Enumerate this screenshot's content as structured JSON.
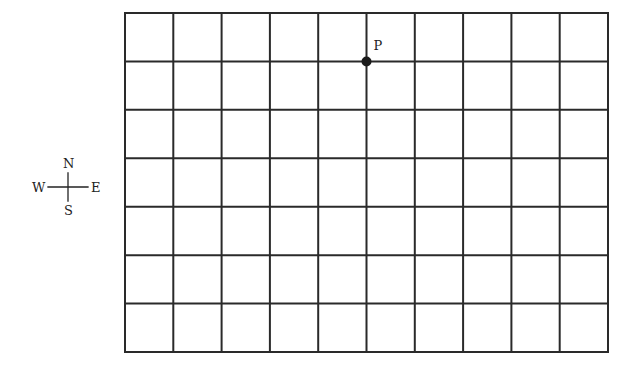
{
  "diagram": {
    "type": "grid-map",
    "grid": {
      "columns": 10,
      "rows": 7,
      "left": 125,
      "top": 13,
      "right": 608,
      "bottom": 352,
      "line_color": "#2a2a2a",
      "line_width": 2
    },
    "point": {
      "label": "P",
      "grid_col": 5,
      "grid_row": 1,
      "color": "#1a1a1a"
    },
    "compass": {
      "north": "N",
      "south": "S",
      "east": "E",
      "west": "W",
      "center_x": 68,
      "center_y": 187
    }
  }
}
